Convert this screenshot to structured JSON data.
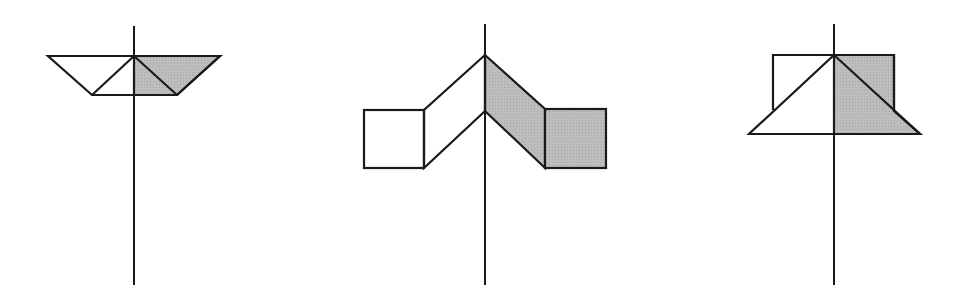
{
  "diagram": {
    "colors": {
      "stroke": "#1a1a1a",
      "shade": "#b8b8b8",
      "background": "#ffffff"
    },
    "figures": [
      {
        "name": "figure-1-trapezoid",
        "axis_x": 134
      },
      {
        "name": "figure-2-wings-with-squares",
        "axis_x": 485
      },
      {
        "name": "figure-3-square-over-triangle",
        "axis_x": 834
      }
    ]
  }
}
